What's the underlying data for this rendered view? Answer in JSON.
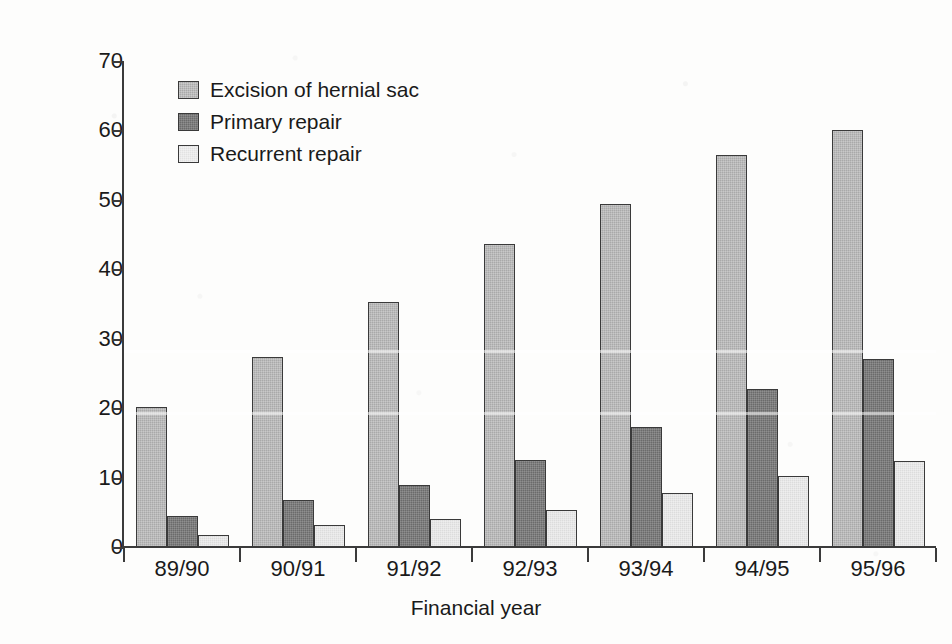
{
  "chart_data": {
    "type": "bar",
    "title": "",
    "xlabel": "Financial year",
    "ylabel": "Percentage of day cases",
    "categories": [
      "89/90",
      "90/91",
      "91/92",
      "92/93",
      "93/94",
      "94/95",
      "95/96"
    ],
    "series": [
      {
        "name": "Excision of hernial sac",
        "color": "#a9a9a9",
        "values": [
          20.2,
          27.3,
          35.3,
          43.6,
          49.4,
          56.4,
          60.1
        ]
      },
      {
        "name": "Primary repair",
        "color": "#6b6b6b",
        "values": [
          4.4,
          6.8,
          8.9,
          12.5,
          17.3,
          22.8,
          27.1
        ]
      },
      {
        "name": "Recurrent repair",
        "color": "#dcdcdc",
        "values": [
          1.8,
          3.1,
          4.0,
          5.3,
          7.8,
          10.3,
          12.4
        ]
      }
    ],
    "ylim": [
      0,
      70
    ],
    "yticks": [
      0,
      10,
      20,
      30,
      40,
      50,
      60,
      70
    ],
    "ytick_labels": [
      "0",
      "10",
      "20",
      "30",
      "40",
      "50",
      "60",
      "70"
    ],
    "grid": false,
    "legend_position": "top-left",
    "bar_group_count": 7,
    "series_count": 3
  },
  "legend": {
    "items": [
      {
        "label": "Excision of hernial sac"
      },
      {
        "label": "Primary repair"
      },
      {
        "label": "Recurrent repair"
      }
    ]
  }
}
